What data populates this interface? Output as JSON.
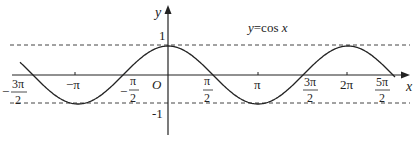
{
  "title": "y=cos x",
  "function_label": "y=cos x",
  "axes": {
    "x_label": "x",
    "y_label": "y",
    "origin_label": "O",
    "y_ticks": [
      {
        "value": 1,
        "label": "1"
      },
      {
        "value": -1,
        "label": "-1"
      }
    ],
    "x_ticks": [
      {
        "value": "-3π/2",
        "num": "3π",
        "den": "2",
        "sign": "−"
      },
      {
        "value": "-π",
        "label": "−π"
      },
      {
        "value": "-π/2",
        "num": "π",
        "den": "2",
        "sign": "−"
      },
      {
        "value": "π/2",
        "num": "π",
        "den": "2",
        "sign": ""
      },
      {
        "value": "π",
        "label": "π"
      },
      {
        "value": "3π/2",
        "num": "3π",
        "den": "2",
        "sign": ""
      },
      {
        "value": "2π",
        "label": "2π"
      },
      {
        "value": "5π/2",
        "num": "5π",
        "den": "2",
        "sign": ""
      }
    ]
  },
  "reference_lines": [
    {
      "y": 1,
      "style": "dashed"
    },
    {
      "y": -1,
      "style": "dashed"
    }
  ],
  "colors": {
    "curve": "#222222",
    "axis": "#222222",
    "dashed": "#444444"
  }
}
